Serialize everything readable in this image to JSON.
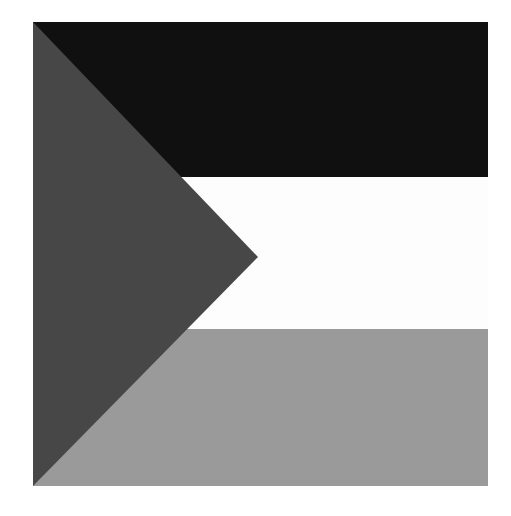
{
  "image": {
    "kind": "flag-illustration",
    "description": "Grayscale horizontal tricolour flag with a triangle at the hoist",
    "canvas_width": 511,
    "canvas_height": 516,
    "background_color": "#ffffff"
  },
  "flag": {
    "name": "flag-graphic",
    "x": 33,
    "y": 22,
    "width": 455,
    "height": 464,
    "orientation": "horizontal-tricolour-with-hoist-triangle",
    "stripes": [
      {
        "name": "top-stripe",
        "color": "#101010",
        "tone": "black",
        "y_start": 22,
        "y_end": 177,
        "height": 155
      },
      {
        "name": "middle-stripe",
        "color": "#fdfdfd",
        "tone": "white",
        "y_start": 177,
        "y_end": 329,
        "height": 152
      },
      {
        "name": "bottom-stripe",
        "color": "#9a9a9a",
        "tone": "light-gray",
        "y_start": 329,
        "y_end": 486,
        "height": 157
      }
    ],
    "triangle": {
      "name": "hoist-triangle",
      "color": "#474747",
      "tone": "dark-gray",
      "points": [
        {
          "x": 33,
          "y": 22
        },
        {
          "x": 258,
          "y": 257
        },
        {
          "x": 33,
          "y": 486
        }
      ],
      "apex_x": 258,
      "apex_y": 257
    }
  },
  "palette": {
    "black": "#101010",
    "white": "#fdfdfd",
    "light_gray": "#9a9a9a",
    "dark_gray": "#474747",
    "page_background": "#ffffff"
  }
}
